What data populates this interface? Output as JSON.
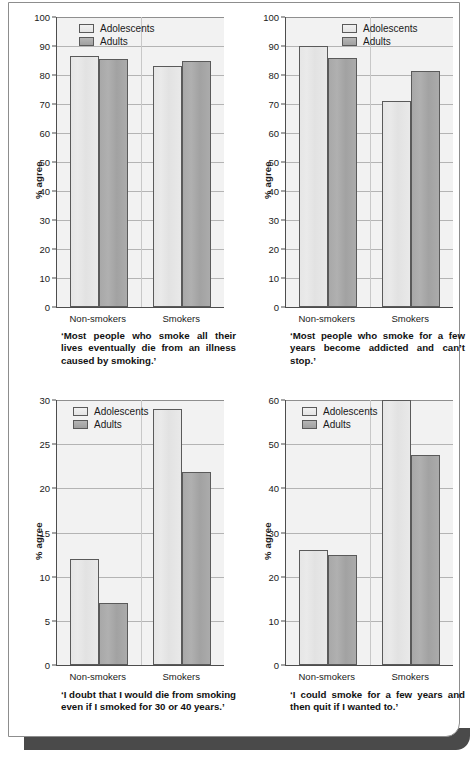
{
  "figure": {
    "legend": {
      "series": [
        "Adolescents",
        "Adults"
      ]
    },
    "categories": [
      "Non-smokers",
      "Smokers"
    ],
    "axis_label": "% agree",
    "colors": {
      "adolescents": "#e6e6e6",
      "adults": "#a8a8a8",
      "plot_background": "#f2f2f2",
      "gridline": "#b4b4b4",
      "axis": "#4d4d4d",
      "card_shadow": "#4a4a4a"
    }
  },
  "chart_data": [
    {
      "id": "panel-top-left",
      "type": "bar",
      "title": "",
      "caption": "‘Most people who smoke all their lives eventually die from an illness caused by smoking.’",
      "xlabel": "",
      "ylabel": "% agree",
      "categories": [
        "Non-smokers",
        "Smokers"
      ],
      "series": [
        {
          "name": "Adolescents",
          "values": [
            86.5,
            83
          ]
        },
        {
          "name": "Adults",
          "values": [
            85.5,
            85
          ]
        }
      ],
      "ylim": [
        0,
        100
      ],
      "yticks": [
        0,
        10,
        20,
        30,
        40,
        50,
        60,
        70,
        80,
        90,
        100
      ],
      "grid": true,
      "legend_position": "top-left-inside"
    },
    {
      "id": "panel-top-right",
      "type": "bar",
      "title": "",
      "caption": "‘Most people who smoke for a few years become addicted and can’t stop.’",
      "xlabel": "",
      "ylabel": "% agree",
      "categories": [
        "Non-smokers",
        "Smokers"
      ],
      "series": [
        {
          "name": "Adolescents",
          "values": [
            90,
            71
          ]
        },
        {
          "name": "Adults",
          "values": [
            86,
            81.3
          ]
        }
      ],
      "ylim": [
        0,
        100
      ],
      "yticks": [
        0,
        10,
        20,
        30,
        40,
        50,
        60,
        70,
        80,
        90,
        100
      ],
      "grid": true,
      "legend_position": "top-right-inside"
    },
    {
      "id": "panel-bottom-left",
      "type": "bar",
      "title": "",
      "caption": "‘I doubt that I would die from smoking even if I smoked for 30 or 40 years.’",
      "xlabel": "",
      "ylabel": "% agree",
      "categories": [
        "Non-smokers",
        "Smokers"
      ],
      "series": [
        {
          "name": "Adolescents",
          "values": [
            12,
            29
          ]
        },
        {
          "name": "Adults",
          "values": [
            7,
            21.8
          ]
        }
      ],
      "ylim": [
        0,
        30
      ],
      "yticks": [
        0,
        5,
        10,
        15,
        20,
        25,
        30
      ],
      "grid": true,
      "legend_position": "top-left-inside"
    },
    {
      "id": "panel-bottom-right",
      "type": "bar",
      "title": "",
      "caption": "‘I could smoke for a few years and then quit if I wanted to.’",
      "xlabel": "",
      "ylabel": "% agree",
      "categories": [
        "Non-smokers",
        "Smokers"
      ],
      "series": [
        {
          "name": "Adolescents",
          "values": [
            26,
            60
          ]
        },
        {
          "name": "Adults",
          "values": [
            25,
            47.5
          ]
        }
      ],
      "ylim": [
        0,
        60
      ],
      "yticks": [
        0,
        10,
        20,
        30,
        40,
        50,
        60
      ],
      "grid": true,
      "legend_position": "top-left-inside"
    }
  ]
}
